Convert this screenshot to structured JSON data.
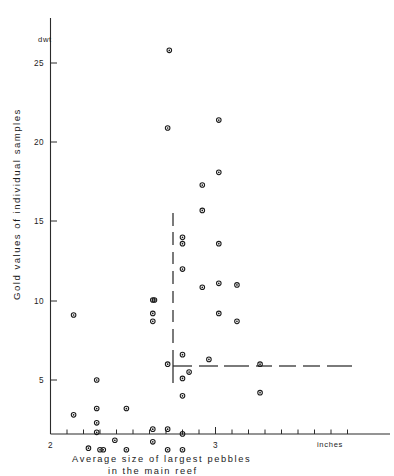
{
  "chart_data": {
    "type": "scatter",
    "title": "",
    "xlabel": "Average size of largest pebbles in the main reef",
    "ylabel": "Gold values of individual samples",
    "x_unit_label": "inches",
    "y_unit_label": "dwt",
    "xlim": [
      2.0,
      3.5
    ],
    "ylim": [
      0,
      27
    ],
    "x_major_ticks": [
      2,
      3
    ],
    "x_major_tick_labels": [
      "2",
      "3"
    ],
    "x_minor_tick_step": 0.1,
    "y_ticks": [
      5,
      10,
      15,
      20,
      25
    ],
    "y_tick_labels": [
      "5",
      "10",
      "15",
      "20",
      "25"
    ],
    "grid": false,
    "legend": "none",
    "marker": "open-circle-with-center-dot",
    "points": [
      {
        "x": 2.14,
        "y": 9.1
      },
      {
        "x": 2.14,
        "y": 2.8
      },
      {
        "x": 2.23,
        "y": 0.7
      },
      {
        "x": 2.28,
        "y": 5.0
      },
      {
        "x": 2.28,
        "y": 3.2
      },
      {
        "x": 2.28,
        "y": 2.3
      },
      {
        "x": 2.28,
        "y": 1.7
      },
      {
        "x": 2.3,
        "y": 0.6
      },
      {
        "x": 2.32,
        "y": 0.6
      },
      {
        "x": 2.39,
        "y": 1.2
      },
      {
        "x": 2.46,
        "y": 3.2
      },
      {
        "x": 2.46,
        "y": 0.6
      },
      {
        "x": 2.62,
        "y": 10.05
      },
      {
        "x": 2.63,
        "y": 10.05
      },
      {
        "x": 2.62,
        "y": 9.2
      },
      {
        "x": 2.62,
        "y": 8.7
      },
      {
        "x": 2.62,
        "y": 1.9
      },
      {
        "x": 2.62,
        "y": 1.1
      },
      {
        "x": 2.72,
        "y": 25.8
      },
      {
        "x": 2.71,
        "y": 20.9
      },
      {
        "x": 2.71,
        "y": 6.0
      },
      {
        "x": 2.71,
        "y": 1.9
      },
      {
        "x": 2.71,
        "y": 0.6
      },
      {
        "x": 2.8,
        "y": 14.0
      },
      {
        "x": 2.8,
        "y": 13.6
      },
      {
        "x": 2.8,
        "y": 12.0
      },
      {
        "x": 2.8,
        "y": 6.6
      },
      {
        "x": 2.8,
        "y": 5.1
      },
      {
        "x": 2.8,
        "y": 4.0
      },
      {
        "x": 2.8,
        "y": 1.6
      },
      {
        "x": 2.8,
        "y": 0.6
      },
      {
        "x": 2.84,
        "y": 5.5
      },
      {
        "x": 2.92,
        "y": 17.3
      },
      {
        "x": 2.92,
        "y": 15.7
      },
      {
        "x": 2.92,
        "y": 10.85
      },
      {
        "x": 2.96,
        "y": 6.3
      },
      {
        "x": 3.02,
        "y": 21.4
      },
      {
        "x": 3.02,
        "y": 18.1
      },
      {
        "x": 3.02,
        "y": 13.6
      },
      {
        "x": 3.02,
        "y": 11.1
      },
      {
        "x": 3.02,
        "y": 9.2
      },
      {
        "x": 3.13,
        "y": 11.0
      },
      {
        "x": 3.13,
        "y": 8.7
      },
      {
        "x": 3.27,
        "y": 6.0
      },
      {
        "x": 3.27,
        "y": 4.2
      }
    ],
    "annotations": [
      {
        "name": "vertical-dashed-line",
        "type": "dashed-vline",
        "x": 2.595,
        "y_from": 4.85,
        "y_to": 14.5
      },
      {
        "name": "horizontal-dashed-line",
        "type": "dashed-hline",
        "y": 3.78,
        "x_from": 2.6,
        "x_to": 3.33
      }
    ]
  }
}
